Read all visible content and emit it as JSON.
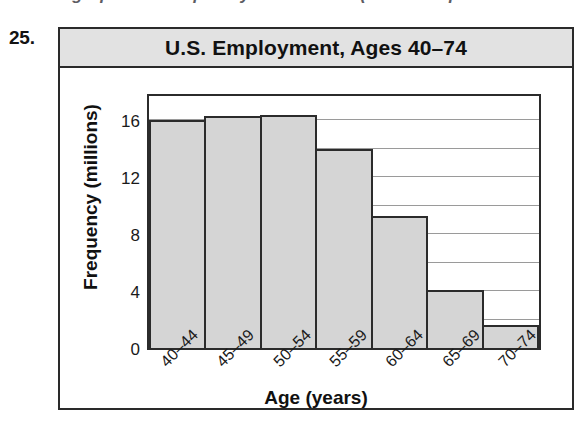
{
  "page": {
    "cut_off_header_text": "the graph of a frequency distribution (see Example",
    "exercise_number": "25."
  },
  "chart_data": {
    "type": "bar",
    "title": "U.S. Employment, Ages 40–74",
    "xlabel": "Age (years)",
    "ylabel": "Frequency (millions)",
    "categories": [
      "40–44",
      "45–49",
      "50–54",
      "55–59",
      "60–64",
      "65–69",
      "70–74"
    ],
    "values": [
      16.0,
      16.3,
      16.4,
      14.0,
      9.3,
      4.1,
      1.6
    ],
    "ylim": [
      0,
      18
    ],
    "ytick_labels": [
      "0",
      "4",
      "8",
      "12",
      "16"
    ],
    "ytick_values": [
      0,
      4,
      8,
      12,
      16
    ],
    "gridline_values": [
      2,
      4,
      6,
      8,
      10,
      12,
      14,
      16
    ],
    "grid": true,
    "legend": "none",
    "bar_fill_color": "#d5d5d5",
    "bar_edge_color": "#2b2b2b",
    "title_bar_color": "#e2e2e2",
    "frame_color": "#2a2a2a"
  }
}
